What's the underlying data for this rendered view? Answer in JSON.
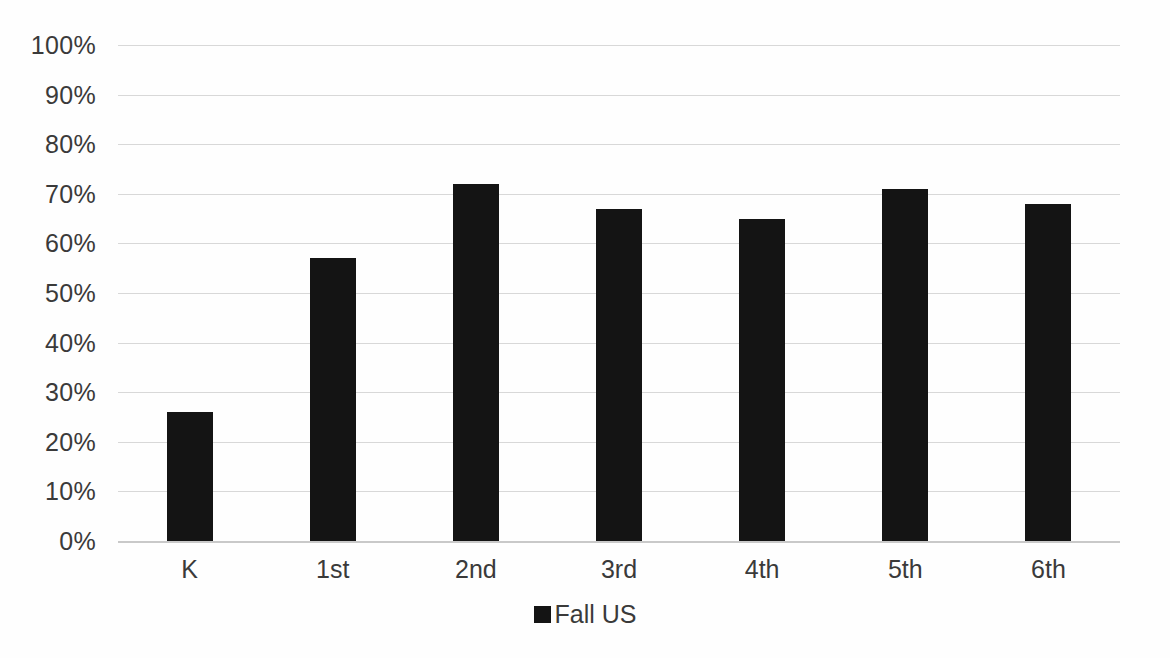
{
  "chart_data": {
    "type": "bar",
    "title": "",
    "subtitle": "",
    "xlabel": "",
    "ylabel": "",
    "categories": [
      "K",
      "1st",
      "2nd",
      "3rd",
      "4th",
      "5th",
      "6th"
    ],
    "values": [
      26,
      57,
      72,
      67,
      65,
      71,
      68
    ],
    "series": [
      {
        "name": "Fall US",
        "values": [
          26,
          57,
          72,
          67,
          65,
          71,
          68
        ]
      }
    ],
    "ylim": [
      0,
      100
    ],
    "ytick_step": 10,
    "ytick_labels": [
      "100%",
      "90%",
      "80%",
      "70%",
      "60%",
      "50%",
      "40%",
      "30%",
      "20%",
      "10%",
      "0%"
    ],
    "ytick_values": [
      100,
      90,
      80,
      70,
      60,
      50,
      40,
      30,
      20,
      10,
      0
    ],
    "value_suffix": "%",
    "grid": true,
    "grid_axis": "y",
    "legend": {
      "position": "bottom",
      "entries": [
        {
          "label": "Fall US",
          "color": "#141414",
          "marker": "square"
        }
      ]
    },
    "colors": {
      "bar": "#141414",
      "gridline": "#d8d8d8",
      "baseline": "#c9c9c9",
      "text": "#3a3a3a",
      "background": "#fefefe"
    }
  }
}
